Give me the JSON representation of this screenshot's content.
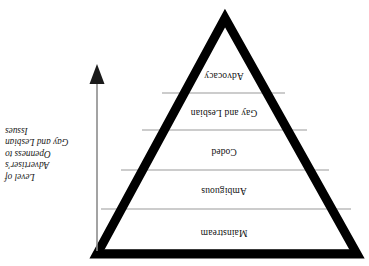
{
  "figure": {
    "type": "inverted-triangle-hierarchy",
    "orientation": "rotated-180-degrees",
    "background_color": "#ffffff",
    "outline_color": "#000000",
    "divider_color": "#999999",
    "text_color": "#111111"
  },
  "triangle": {
    "name": "inverted-triangle",
    "bands": [
      {
        "id": "band-mainstream",
        "label": "Mainstream",
        "order": 1
      },
      {
        "id": "band-ambiguous",
        "label": "Ambiguous",
        "order": 2
      },
      {
        "id": "band-coded",
        "label": "Coded",
        "order": 3
      },
      {
        "id": "band-gay-and-lesbian",
        "label": "Gay and Lesbian",
        "order": 4
      },
      {
        "id": "band-advocacy",
        "label": "Advocacy",
        "order": 5
      }
    ]
  },
  "arrow": {
    "name": "direction-arrow",
    "direction": "down",
    "head": "solid-triangle",
    "color": "#808080"
  },
  "caption": {
    "name": "axis-caption",
    "full_text": "Level of Advertiser's Openness to Gay and Lesbian Issues",
    "lines": [
      "Level of",
      "Advertiser's",
      "Openness to",
      "Gay and Lesbian",
      "Issues"
    ]
  }
}
